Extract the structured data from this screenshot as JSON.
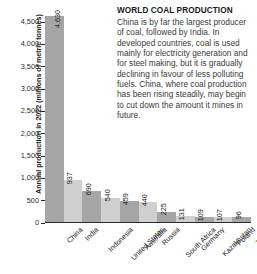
{
  "article": {
    "headline": "WORLD COAL PRODUCTION",
    "body": "China is by far the largest producer of coal, followed by India. In developed countries, coal is used mainly for electricity generation and for steel making, but it is gradually declining in favour of less polluting fuels. China, where coal production has been rising steadily, may begin to cut down the amount it mines in future."
  },
  "chart_data": {
    "type": "bar",
    "title": "WORLD COAL PRODUCTION",
    "xlabel": "",
    "ylabel": "Annual production in 2022 (millions of metric tonnes)",
    "ylim": [
      0,
      4500
    ],
    "yticks": [
      "0",
      "500",
      "1,000",
      "1,500",
      "2,000",
      "2,500",
      "3,000",
      "3,500",
      "4,000",
      "4,500"
    ],
    "ytick_values": [
      0,
      500,
      1000,
      1500,
      2000,
      2500,
      3000,
      3500,
      4000,
      4500
    ],
    "grid": false,
    "legend": "none",
    "categories": [
      "China",
      "India",
      "Indonesia",
      "United States",
      "Australia",
      "Russia",
      "South Africa",
      "Germany",
      "Kazakhstan",
      "Poland",
      "Turkey"
    ],
    "values": [
      4630,
      937,
      690,
      540,
      459,
      440,
      225,
      131,
      109,
      107,
      96
    ],
    "value_labels": [
      "4,630",
      "937",
      "690",
      "540",
      "459",
      "440",
      "225",
      "131",
      "109",
      "107",
      "96"
    ],
    "bar_colors": [
      "#a6a6a6",
      "#cfcfcf",
      "#a6a6a6",
      "#cfcfcf",
      "#a6a6a6",
      "#cfcfcf",
      "#a6a6a6",
      "#cfcfcf",
      "#a6a6a6",
      "#cfcfcf",
      "#a6a6a6"
    ]
  }
}
